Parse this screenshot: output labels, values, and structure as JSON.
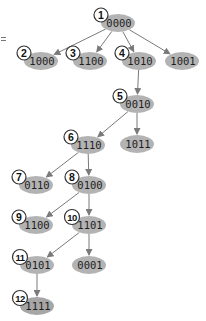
{
  "diagram": {
    "title": "",
    "colors": {
      "oval_fill": "#b3b3b3",
      "oval_fill_dark": "#a6a6a6",
      "edge": "#7a7a7a",
      "badge_fill": "#ffffff",
      "badge_stroke": "#333333"
    },
    "nodes": [
      {
        "id": "n1",
        "step": "1",
        "label": "0000",
        "cx": 118,
        "cy": 23
      },
      {
        "id": "n2",
        "step": "2",
        "label": "1000",
        "cx": 41,
        "cy": 61
      },
      {
        "id": "n3",
        "step": "3",
        "label": "1100",
        "cx": 90,
        "cy": 61
      },
      {
        "id": "n4",
        "step": "4",
        "label": "1010",
        "cx": 139,
        "cy": 61
      },
      {
        "id": "n1001",
        "step": "",
        "label": "1001",
        "cx": 182,
        "cy": 61
      },
      {
        "id": "n5",
        "step": "5",
        "label": "0010",
        "cx": 137,
        "cy": 104
      },
      {
        "id": "n1011",
        "step": "",
        "label": "1011",
        "cx": 137,
        "cy": 144
      },
      {
        "id": "n6",
        "step": "6",
        "label": "1110",
        "cx": 88,
        "cy": 145
      },
      {
        "id": "n7",
        "step": "7",
        "label": "0110",
        "cx": 36,
        "cy": 185
      },
      {
        "id": "n8",
        "step": "8",
        "label": "0100",
        "cx": 89,
        "cy": 185
      },
      {
        "id": "n9",
        "step": "9",
        "label": "1100",
        "cx": 36,
        "cy": 225
      },
      {
        "id": "n10",
        "step": "10",
        "label": "1101",
        "cx": 89,
        "cy": 225
      },
      {
        "id": "n11",
        "step": "11",
        "label": "0101",
        "cx": 37,
        "cy": 265
      },
      {
        "id": "n0001",
        "step": "",
        "label": "0001",
        "cx": 89,
        "cy": 265
      },
      {
        "id": "n12",
        "step": "12",
        "label": "1111",
        "cx": 37,
        "cy": 306
      }
    ],
    "edges": [
      {
        "from": "n1",
        "to": "n2"
      },
      {
        "from": "n1",
        "to": "n3"
      },
      {
        "from": "n1",
        "to": "n4"
      },
      {
        "from": "n1",
        "to": "n1001"
      },
      {
        "from": "n4",
        "to": "n5"
      },
      {
        "from": "n5",
        "to": "n6"
      },
      {
        "from": "n5",
        "to": "n1011"
      },
      {
        "from": "n6",
        "to": "n7"
      },
      {
        "from": "n6",
        "to": "n8"
      },
      {
        "from": "n8",
        "to": "n9"
      },
      {
        "from": "n8",
        "to": "n10"
      },
      {
        "from": "n10",
        "to": "n11"
      },
      {
        "from": "n10",
        "to": "n0001"
      },
      {
        "from": "n11",
        "to": "n12"
      }
    ]
  }
}
